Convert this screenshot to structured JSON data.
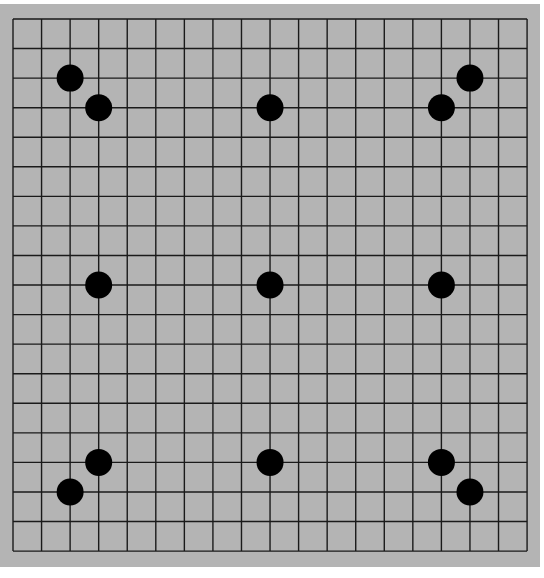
{
  "game": "Go",
  "board": {
    "size": 19,
    "background_color": "#b4b4b4",
    "line_color": "#1a1a1a",
    "stone_color": "#000000",
    "origin": {
      "x": 13,
      "y": 19
    },
    "cell_w": 28.56,
    "cell_h": 29.56
  },
  "stones": [
    {
      "color": "black",
      "col": 2,
      "row": 2
    },
    {
      "color": "black",
      "col": 3,
      "row": 3
    },
    {
      "color": "black",
      "col": 9,
      "row": 3
    },
    {
      "color": "black",
      "col": 15,
      "row": 3
    },
    {
      "color": "black",
      "col": 16,
      "row": 2
    },
    {
      "color": "black",
      "col": 3,
      "row": 9
    },
    {
      "color": "black",
      "col": 9,
      "row": 9
    },
    {
      "color": "black",
      "col": 15,
      "row": 9
    },
    {
      "color": "black",
      "col": 3,
      "row": 15
    },
    {
      "color": "black",
      "col": 2,
      "row": 16
    },
    {
      "color": "black",
      "col": 9,
      "row": 15
    },
    {
      "color": "black",
      "col": 15,
      "row": 15
    },
    {
      "color": "black",
      "col": 16,
      "row": 16
    }
  ]
}
